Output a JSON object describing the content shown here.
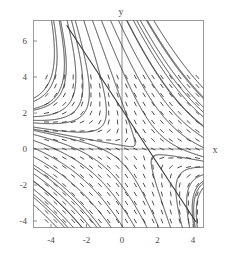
{
  "chart_data": {
    "type": "line",
    "title": "",
    "subtitle": "",
    "xlabel": "x",
    "ylabel": "y",
    "xlim": [
      -4.7,
      4.7
    ],
    "ylim": [
      -4.7,
      7.4
    ],
    "grid": false,
    "legend": null,
    "frame": true,
    "plot_kind": "slope-field-with-solution-curves",
    "x_ticks": [
      -4,
      -2,
      0,
      2,
      4
    ],
    "x_tick_labels": [
      "-4",
      "-2",
      "0",
      "2",
      "4"
    ],
    "y_ticks": [
      -4,
      -2,
      0,
      2,
      4,
      6
    ],
    "y_tick_labels": [
      "-4",
      "-2",
      "0",
      "2",
      "4",
      "6"
    ],
    "axis_lines": {
      "x_axis_at_y": 0,
      "y_axis_at_x": 0
    },
    "slope_field": {
      "x_range": [
        -4.25,
        4.25
      ],
      "y_range": [
        -4.0,
        4.0
      ],
      "x_step": 0.5,
      "y_step": 0.5,
      "dash_length_px": 5,
      "description": "short tangent dashes of dy/dx = -(x+y)/(x-y) style saddle field"
    },
    "separatrix_line": {
      "description": "straight solution line through the saddle point",
      "slope": -1.5,
      "intercept": 2.2,
      "x_from": -3.1,
      "x_to": 4.15
    },
    "solution_curves_note": "family of hyperbola-like integral curves, symmetric about the straight separatrix, forming a saddle pattern centred near (1, 0)",
    "series": [
      {
        "name": "separatrix",
        "values": []
      },
      {
        "name": "integral-curves",
        "values": []
      }
    ],
    "colors": {
      "curve": "#3a3a3a",
      "field": "#4f4f4f",
      "frame": "#9a9a9a",
      "axis": "#8d8d8d",
      "text": "#4a4a4a",
      "background": "#ffffff"
    }
  },
  "figure": {
    "x_axis_label": "x",
    "y_axis_label": "y"
  }
}
